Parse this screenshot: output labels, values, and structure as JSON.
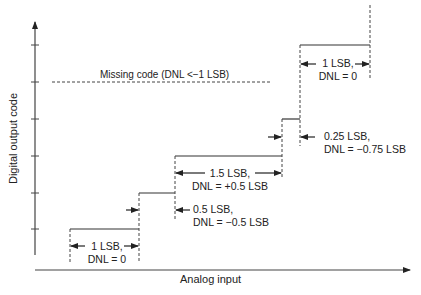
{
  "diagram": {
    "y_axis_label": "Digital output code",
    "x_axis_label": "Analog input",
    "missing_code_label": "Missing code (DNL <−1 LSB)",
    "annotations": [
      {
        "id": "step1",
        "line1": "1 LSB,",
        "line2": "DNL = 0"
      },
      {
        "id": "step2",
        "line1": "0.5 LSB,",
        "line2": "DNL = −0.5 LSB"
      },
      {
        "id": "step3",
        "line1": "1.5 LSB,",
        "line2": "DNL = +0.5 LSB"
      },
      {
        "id": "step4",
        "line1": "0.25 LSB,",
        "line2": "DNL = −0.75 LSB"
      },
      {
        "id": "step5",
        "line1": "1 LSB,",
        "line2": "DNL = 0"
      }
    ],
    "colors": {
      "line": "#333333",
      "text": "#222222",
      "background": "#ffffff"
    }
  }
}
